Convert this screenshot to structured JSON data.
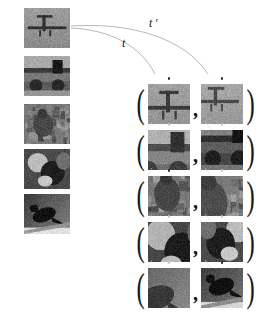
{
  "figure": {
    "type": "contrastive-augmentation-pair-diagram",
    "background_color": "#ffffff",
    "ink_color": "#1a1a1a"
  },
  "transform_labels": {
    "t": "t",
    "t_prime": "t ′"
  },
  "source_images": [
    {
      "id": "source-1",
      "caption": "airplane",
      "tone": "light-gray"
    },
    {
      "id": "source-2",
      "caption": "vintage-car",
      "tone": "dark-gray"
    },
    {
      "id": "source-3",
      "caption": "deer",
      "tone": "mid-gray"
    },
    {
      "id": "source-4",
      "caption": "animals",
      "tone": "dark-gray"
    },
    {
      "id": "source-5",
      "caption": "bird",
      "tone": "dark-gray"
    }
  ],
  "pair_rows": [
    {
      "id": "pair-row-1",
      "open_paren": "(",
      "separator": ",",
      "close_paren": ")",
      "left_patch": {
        "id": "patch-1-left",
        "caption": "airplane-crop-a"
      },
      "right_patch": {
        "id": "patch-1-right",
        "caption": "airplane-crop-b"
      }
    },
    {
      "id": "pair-row-2",
      "open_paren": "(",
      "separator": ",",
      "close_paren": ")",
      "left_patch": {
        "id": "patch-2-left",
        "caption": "car-crop-a"
      },
      "right_patch": {
        "id": "patch-2-right",
        "caption": "car-crop-b"
      }
    },
    {
      "id": "pair-row-3",
      "open_paren": "(",
      "separator": ",",
      "close_paren": ")",
      "left_patch": {
        "id": "patch-3-left",
        "caption": "deer-crop-a"
      },
      "right_patch": {
        "id": "patch-3-right",
        "caption": "deer-crop-b"
      }
    },
    {
      "id": "pair-row-4",
      "open_paren": "(",
      "separator": ",",
      "close_paren": ")",
      "left_patch": {
        "id": "patch-4-left",
        "caption": "animal-crop-a"
      },
      "right_patch": {
        "id": "patch-4-right",
        "caption": "animal-crop-b"
      }
    },
    {
      "id": "pair-row-5",
      "open_paren": "(",
      "separator": ",",
      "close_paren": ")",
      "left_patch": {
        "id": "patch-5-left",
        "caption": "bird-crop-a"
      },
      "right_patch": {
        "id": "patch-5-right",
        "caption": "bird-crop-b"
      }
    }
  ]
}
